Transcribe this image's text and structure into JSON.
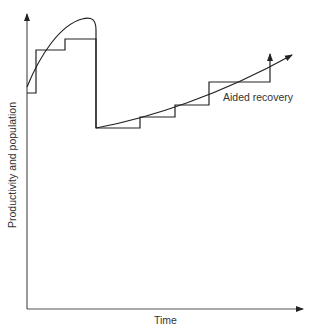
{
  "diagram": {
    "axes": {
      "x_label": "Time",
      "y_label": "Productivity and population"
    },
    "annotations": {
      "aided_recovery": "Aided recovery"
    },
    "colors": {
      "line": "#222222",
      "axis": "#555555",
      "text": "#333333"
    }
  }
}
